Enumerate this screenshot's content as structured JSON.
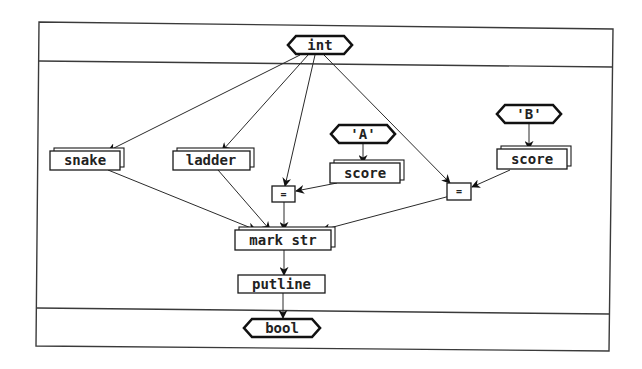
{
  "diagram": {
    "type": "dataflow",
    "frame": {
      "sections": [
        "input",
        "body",
        "output"
      ]
    },
    "nodes": {
      "int": {
        "label": "int",
        "kind": "type-hexagon"
      },
      "snake": {
        "label": "snake",
        "kind": "stacked-box"
      },
      "ladder": {
        "label": "ladder",
        "kind": "stacked-box"
      },
      "const_a": {
        "label": "'A'",
        "kind": "constant-hexagon"
      },
      "score_a": {
        "label": "score",
        "kind": "stacked-box"
      },
      "const_b": {
        "label": "'B'",
        "kind": "constant-hexagon"
      },
      "score_b": {
        "label": "score",
        "kind": "stacked-box"
      },
      "eq1": {
        "label": "=",
        "kind": "box"
      },
      "eq2": {
        "label": "=",
        "kind": "box"
      },
      "mark_str": {
        "label": "mark str",
        "kind": "stacked-box"
      },
      "putline": {
        "label": "putline",
        "kind": "box"
      },
      "bool": {
        "label": "bool",
        "kind": "type-hexagon"
      }
    },
    "edges": [
      {
        "from": "int",
        "to": "snake"
      },
      {
        "from": "int",
        "to": "ladder"
      },
      {
        "from": "int",
        "to": "eq1"
      },
      {
        "from": "int",
        "to": "eq2"
      },
      {
        "from": "const_a",
        "to": "score_a"
      },
      {
        "from": "const_b",
        "to": "score_b"
      },
      {
        "from": "score_a",
        "to": "eq1"
      },
      {
        "from": "score_b",
        "to": "eq2"
      },
      {
        "from": "snake",
        "to": "mark_str"
      },
      {
        "from": "ladder",
        "to": "mark_str"
      },
      {
        "from": "eq1",
        "to": "mark_str"
      },
      {
        "from": "eq2",
        "to": "mark_str"
      },
      {
        "from": "mark_str",
        "to": "putline"
      },
      {
        "from": "putline",
        "to": "bool"
      }
    ],
    "colors": {
      "stroke": "#1a1a1a",
      "background": "#ffffff"
    }
  }
}
